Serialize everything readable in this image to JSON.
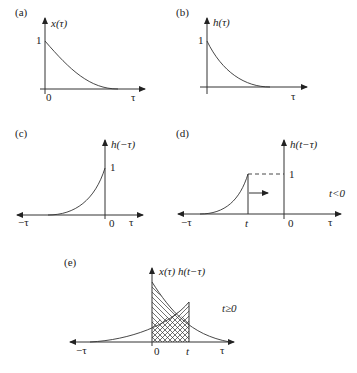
{
  "figure": {
    "panels": [
      {
        "id": "a",
        "tag": "(a)",
        "ylabel": "x(τ)",
        "one": "1",
        "zero": "0",
        "xlabel": "τ"
      },
      {
        "id": "b",
        "tag": "(b)",
        "ylabel": "h(τ)",
        "one": "1",
        "xlabel": "τ"
      },
      {
        "id": "c",
        "tag": "(c)",
        "ylabel": "h(−τ)",
        "one": "1",
        "zero": "0",
        "xlabel": "τ",
        "neg_label": "−τ"
      },
      {
        "id": "d",
        "tag": "(d)",
        "ylabel": "h(t−τ)",
        "one": "1",
        "zero": "0",
        "xlabel": "τ",
        "neg_label": "−τ",
        "t_label": "t",
        "condition": "t<0"
      },
      {
        "id": "e",
        "tag": "(e)",
        "ylabel": "x(τ) h(t−τ)",
        "zero": "0",
        "xlabel": "τ",
        "neg_label": "−τ",
        "t_label": "t",
        "condition": "t≥0"
      }
    ]
  }
}
